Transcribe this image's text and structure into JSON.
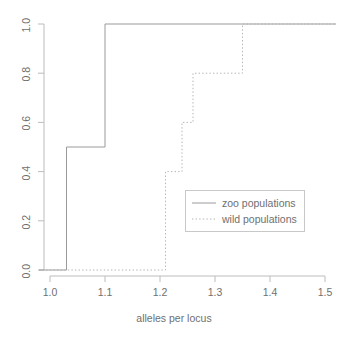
{
  "chart_data": {
    "type": "line",
    "title": "",
    "xlabel": "alleles per locus",
    "ylabel": "",
    "xlim": [
      0.975,
      1.525
    ],
    "ylim": [
      -0.04,
      1.04
    ],
    "grid": false,
    "legend_position": "center-right",
    "xticks": [
      "1.0",
      "1.1",
      "1.2",
      "1.3",
      "1.4",
      "1.5"
    ],
    "xtick_values": [
      1.0,
      1.1,
      1.2,
      1.3,
      1.4,
      1.5
    ],
    "yticks": [
      "0.0",
      "0.2",
      "0.4",
      "0.6",
      "0.8",
      "1.0"
    ],
    "ytick_values": [
      0.0,
      0.2,
      0.4,
      0.6,
      0.8,
      1.0
    ],
    "series": [
      {
        "name": "zoo populations",
        "style": "solid",
        "color": "#9a9a9a",
        "x": [
          0.98,
          1.03,
          1.03,
          1.1,
          1.1,
          1.52
        ],
        "y": [
          0.0,
          0.0,
          0.5,
          0.5,
          1.0,
          1.0
        ],
        "steps": [
          {
            "x": 1.03,
            "from": 0.0,
            "to": 0.5
          },
          {
            "x": 1.1,
            "from": 0.5,
            "to": 1.0
          }
        ]
      },
      {
        "name": "wild populations",
        "style": "dotted",
        "color": "#b4b4b4",
        "x": [
          0.98,
          1.21,
          1.21,
          1.24,
          1.24,
          1.26,
          1.26,
          1.35,
          1.35,
          1.52
        ],
        "y": [
          0.0,
          0.0,
          0.4,
          0.4,
          0.6,
          0.6,
          0.8,
          0.8,
          1.0,
          1.0
        ],
        "steps": [
          {
            "x": 1.21,
            "from": 0.0,
            "to": 0.4
          },
          {
            "x": 1.24,
            "from": 0.4,
            "to": 0.6
          },
          {
            "x": 1.26,
            "from": 0.6,
            "to": 0.8
          },
          {
            "x": 1.35,
            "from": 0.8,
            "to": 1.0
          }
        ]
      }
    ]
  },
  "legend": {
    "entries": [
      {
        "label": "zoo populations",
        "style": "solid"
      },
      {
        "label": "wild populations",
        "style": "dotted"
      }
    ]
  },
  "axis": {
    "x_title": "alleles per locus",
    "x_tick_0": "1.0",
    "x_tick_1": "1.1",
    "x_tick_2": "1.2",
    "x_tick_3": "1.3",
    "x_tick_4": "1.4",
    "x_tick_5": "1.5",
    "y_tick_0": "0.0",
    "y_tick_1": "0.2",
    "y_tick_2": "0.4",
    "y_tick_3": "0.6",
    "y_tick_4": "0.8",
    "y_tick_5": "1.0"
  },
  "colors": {
    "axis": "#b8b8b8",
    "zoo_line": "#9a9a9a",
    "wild_line": "#b4b4b4",
    "text": "#6f6f6f",
    "legend_border": "#c8c8c8",
    "background": "#ffffff"
  }
}
